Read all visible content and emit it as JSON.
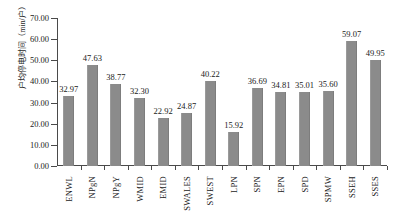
{
  "chart_data": {
    "type": "bar",
    "title": "",
    "subtitle": "",
    "xlabel": "",
    "ylabel": "户均停电时间（min/户）",
    "ylim": [
      0,
      70
    ],
    "ytick_step": 10,
    "ytick_labels": [
      "0.00",
      "10.00",
      "20.00",
      "30.00",
      "40.00",
      "50.00",
      "60.00",
      "70.00"
    ],
    "ytick_values": [
      0,
      10,
      20,
      30,
      40,
      50,
      60,
      70
    ],
    "grid": false,
    "legend": null,
    "bar_color": "#8b8b8b",
    "axis_color": "#4a4a4a",
    "text_color": "#1a1a1a",
    "value_label_format": "0.00",
    "categories": [
      "ENWL",
      "NPgN",
      "NPgY",
      "WMID",
      "EMID",
      "SWALES",
      "SWEST",
      "LPN",
      "SPN",
      "EPN",
      "SPD",
      "SPMW",
      "SSEH",
      "SSES"
    ],
    "values": [
      32.97,
      47.63,
      38.77,
      32.3,
      22.92,
      24.87,
      40.22,
      15.92,
      36.69,
      34.81,
      35.01,
      35.6,
      59.07,
      49.95
    ],
    "value_labels": [
      "32.97",
      "47.63",
      "38.77",
      "32.30",
      "22.92",
      "24.87",
      "40.22",
      "15.92",
      "36.69",
      "34.81",
      "35.01",
      "35.60",
      "59.07",
      "49.95"
    ]
  }
}
